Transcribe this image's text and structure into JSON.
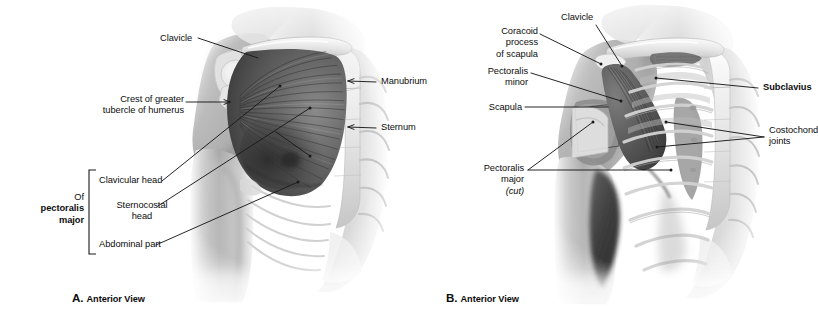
{
  "figure": {
    "type": "anatomical-illustration",
    "background_color": "#ffffff",
    "line_color": "#1a1a1a",
    "text_color": "#0d0d0d",
    "panels": [
      {
        "id": "A",
        "caption_letter": "A.",
        "caption_text": "Anterior View",
        "labels": [
          {
            "key": "clavicle",
            "text": "Clavicle",
            "bold": false,
            "align": "left"
          },
          {
            "key": "crest",
            "text": "Crest of greater\ntubercle of humerus",
            "bold": false,
            "align": "right"
          },
          {
            "key": "manubrium",
            "text": "Manubrium",
            "bold": false,
            "align": "left"
          },
          {
            "key": "sternum",
            "text": "Sternum",
            "bold": false,
            "align": "left"
          },
          {
            "key": "clavhead",
            "text": "Clavicular head",
            "bold": false,
            "align": "left"
          },
          {
            "key": "sternohead",
            "text": "Sternocostal\nhead",
            "bold": false,
            "align": "center"
          },
          {
            "key": "abdpart",
            "text": "Abdominal part",
            "bold": false,
            "align": "left"
          }
        ],
        "bracket_group": {
          "line1": "Of",
          "line2": "pectoralis",
          "line3": "major",
          "line1_bold": false,
          "line2_bold": true,
          "line3_bold": true
        }
      },
      {
        "id": "B",
        "caption_letter": "B.",
        "caption_text": "Anterior View",
        "labels": [
          {
            "key": "coracoid",
            "text": "Coracoid\nprocess\nof scapula",
            "bold": false,
            "align": "right"
          },
          {
            "key": "clavicle",
            "text": "Clavicle",
            "bold": false,
            "align": "left"
          },
          {
            "key": "pecminor",
            "text": "Pectoralis\nminor",
            "bold": true,
            "align": "right"
          },
          {
            "key": "scapula",
            "text": "Scapula",
            "bold": false,
            "align": "right"
          },
          {
            "key": "pecmajor",
            "text": "Pectoralis\nmajor",
            "bold": false,
            "align": "right",
            "italic_suffix": "(cut)"
          },
          {
            "key": "subclavius",
            "text": "Subclavius",
            "bold": true,
            "align": "left"
          },
          {
            "key": "costo",
            "text": "Costochondral\njoints",
            "bold": false,
            "align": "left"
          }
        ]
      }
    ]
  }
}
